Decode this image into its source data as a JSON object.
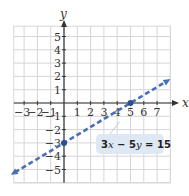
{
  "chart_data": {
    "type": "line",
    "title": "",
    "xlabel": "x",
    "ylabel": "y",
    "xlim": [
      -4,
      8
    ],
    "ylim": [
      -6,
      6
    ],
    "grid": true,
    "x_ticks": [
      -3,
      -2,
      -1,
      1,
      2,
      3,
      4,
      5,
      6,
      7
    ],
    "y_ticks": [
      5,
      4,
      3,
      2,
      1,
      -1,
      -2,
      -3,
      -4,
      -5
    ],
    "series": [
      {
        "name": "3x − 5y = 15",
        "style": "dashed",
        "arrows": "both",
        "x": [
          -4,
          0,
          5,
          8
        ],
        "y": [
          -5.4,
          -3,
          0,
          1.8
        ]
      }
    ],
    "points": [
      {
        "x": 0,
        "y": -3,
        "label": "y-intercept"
      },
      {
        "x": 5,
        "y": 0,
        "label": "x-intercept"
      }
    ],
    "annotations": [
      {
        "text": "3x − 5y = 15",
        "anchor_x": 4.5,
        "anchor_y": -3
      }
    ]
  },
  "labels": {
    "x_axis": "x",
    "y_axis": "y",
    "equation_parts": [
      "3",
      "x",
      " − 5",
      "y",
      " = 15"
    ]
  },
  "colors": {
    "line": "#4a6fb5",
    "grid": "#d6d6d6",
    "axis": "#333333",
    "label_bg": "#dde8f4"
  }
}
